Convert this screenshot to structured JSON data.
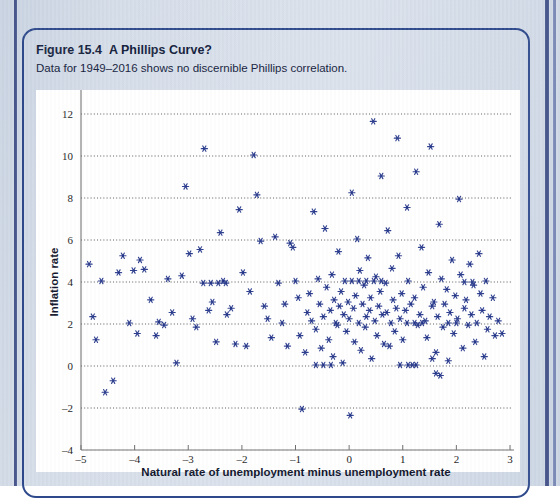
{
  "figure": {
    "number": "Figure 15.4",
    "title": "A Phillips Curve?",
    "subtitle": "Data for 1949–2016 shows no discernible Phillips correlation."
  },
  "colors": {
    "marker": "#24368a",
    "frame": "#2f4a8c",
    "page_background": "#d5dde8",
    "panel_background": "#ffffff",
    "gridline": "#3b3b3b",
    "axis": "#6f6f6f"
  },
  "chart_data": {
    "type": "scatter",
    "title": "A Phillips Curve?",
    "subtitle": "Data for 1949–2016 shows no discernible Phillips correlation.",
    "xlabel": "Natural rate of unemployment minus unemployment rate",
    "ylabel": "Inflation rate",
    "xlim": [
      -5,
      3
    ],
    "ylim": [
      -4,
      12
    ],
    "xticks": [
      -5,
      -4,
      -3,
      -2,
      -1,
      0,
      1,
      2,
      3
    ],
    "xticklabels": [
      "–5",
      "–4",
      "–3",
      "–2",
      "–1",
      "0",
      "1",
      "2",
      "3"
    ],
    "yticks": [
      -4,
      -2,
      0,
      2,
      4,
      6,
      8,
      10,
      12
    ],
    "yticklabels": [
      "–4",
      "–2",
      "0",
      "2",
      "4",
      "6",
      "8",
      "10",
      "12"
    ],
    "grid": "horizontal-dotted",
    "legend": "none",
    "marker_style": "asterisk",
    "marker_color": "#24368a",
    "n_points": 201,
    "points": [
      [
        -4.85,
        4.85
      ],
      [
        -4.78,
        2.35
      ],
      [
        -4.72,
        1.25
      ],
      [
        -4.62,
        4.05
      ],
      [
        -4.55,
        -1.25
      ],
      [
        -4.4,
        -0.7
      ],
      [
        -4.3,
        4.45
      ],
      [
        -4.22,
        5.25
      ],
      [
        -4.1,
        2.05
      ],
      [
        -4.02,
        4.55
      ],
      [
        -3.95,
        1.55
      ],
      [
        -3.9,
        5.05
      ],
      [
        -3.82,
        4.6
      ],
      [
        -3.7,
        3.15
      ],
      [
        -3.6,
        1.45
      ],
      [
        -3.55,
        2.1
      ],
      [
        -3.45,
        1.95
      ],
      [
        -3.38,
        4.15
      ],
      [
        -3.3,
        2.55
      ],
      [
        -3.22,
        0.15
      ],
      [
        -3.12,
        4.3
      ],
      [
        -3.05,
        8.55
      ],
      [
        -2.98,
        5.35
      ],
      [
        -2.92,
        2.25
      ],
      [
        -2.85,
        1.85
      ],
      [
        -2.78,
        5.55
      ],
      [
        -2.7,
        10.35
      ],
      [
        -2.62,
        2.65
      ],
      [
        -2.55,
        3.05
      ],
      [
        -2.48,
        1.15
      ],
      [
        -2.4,
        6.35
      ],
      [
        -2.35,
        4.05
      ],
      [
        -2.28,
        2.45
      ],
      [
        -2.2,
        2.75
      ],
      [
        -2.12,
        1.05
      ],
      [
        -2.05,
        7.45
      ],
      [
        -1.98,
        4.45
      ],
      [
        -1.92,
        0.95
      ],
      [
        -1.85,
        3.55
      ],
      [
        -1.78,
        10.05
      ],
      [
        -1.72,
        8.15
      ],
      [
        -1.65,
        5.95
      ],
      [
        -1.58,
        2.85
      ],
      [
        -1.52,
        2.25
      ],
      [
        -1.45,
        1.35
      ],
      [
        -1.38,
        6.15
      ],
      [
        -1.32,
        3.95
      ],
      [
        -1.25,
        2.05
      ],
      [
        -1.2,
        2.95
      ],
      [
        -1.15,
        0.95
      ],
      [
        -1.1,
        5.85
      ],
      [
        -1.05,
        5.65
      ],
      [
        -1.0,
        4.05
      ],
      [
        -0.95,
        3.25
      ],
      [
        -0.92,
        1.45
      ],
      [
        -0.88,
        -2.05
      ],
      [
        -0.82,
        0.65
      ],
      [
        -0.78,
        2.55
      ],
      [
        -0.74,
        3.45
      ],
      [
        -0.7,
        2.15
      ],
      [
        -0.66,
        7.35
      ],
      [
        -0.62,
        1.75
      ],
      [
        -0.58,
        4.15
      ],
      [
        -0.55,
        2.95
      ],
      [
        -0.52,
        0.85
      ],
      [
        -0.48,
        2.35
      ],
      [
        -0.45,
        6.55
      ],
      [
        -0.42,
        3.75
      ],
      [
        -0.38,
        1.25
      ],
      [
        -0.35,
        2.65
      ],
      [
        -0.32,
        4.35
      ],
      [
        -0.3,
        0.45
      ],
      [
        -0.28,
        3.15
      ],
      [
        -0.25,
        2.05
      ],
      [
        -0.22,
        1.95
      ],
      [
        -0.2,
        5.45
      ],
      [
        -0.18,
        2.85
      ],
      [
        -0.15,
        3.55
      ],
      [
        -0.12,
        0.15
      ],
      [
        -0.1,
        2.45
      ],
      [
        -0.08,
        4.05
      ],
      [
        -0.05,
        1.65
      ],
      [
        -0.02,
        3.05
      ],
      [
        0.0,
        2.25
      ],
      [
        0.02,
        -2.35
      ],
      [
        0.05,
        8.25
      ],
      [
        0.08,
        2.75
      ],
      [
        0.1,
        1.15
      ],
      [
        0.12,
        3.35
      ],
      [
        0.15,
        6.05
      ],
      [
        0.18,
        2.05
      ],
      [
        0.2,
        4.55
      ],
      [
        0.22,
        0.75
      ],
      [
        0.25,
        2.95
      ],
      [
        0.28,
        3.85
      ],
      [
        0.3,
        1.85
      ],
      [
        0.32,
        2.35
      ],
      [
        0.35,
        5.15
      ],
      [
        0.38,
        2.65
      ],
      [
        0.4,
        3.25
      ],
      [
        0.42,
        0.35
      ],
      [
        0.45,
        11.65
      ],
      [
        0.48,
        2.15
      ],
      [
        0.5,
        4.25
      ],
      [
        0.52,
        1.45
      ],
      [
        0.55,
        2.85
      ],
      [
        0.58,
        3.55
      ],
      [
        0.6,
        9.05
      ],
      [
        0.62,
        2.45
      ],
      [
        0.65,
        1.05
      ],
      [
        0.68,
        3.95
      ],
      [
        0.7,
        2.55
      ],
      [
        0.72,
        6.45
      ],
      [
        0.75,
        0.95
      ],
      [
        0.78,
        2.05
      ],
      [
        0.8,
        4.65
      ],
      [
        0.82,
        3.15
      ],
      [
        0.85,
        1.65
      ],
      [
        0.88,
        2.75
      ],
      [
        0.9,
        10.85
      ],
      [
        0.92,
        5.25
      ],
      [
        0.95,
        2.25
      ],
      [
        0.98,
        3.45
      ],
      [
        1.0,
        1.25
      ],
      [
        1.05,
        2.65
      ],
      [
        1.08,
        7.55
      ],
      [
        1.1,
        4.05
      ],
      [
        1.15,
        2.95
      ],
      [
        1.18,
        0.05
      ],
      [
        1.22,
        3.25
      ],
      [
        1.25,
        9.25
      ],
      [
        1.28,
        1.95
      ],
      [
        1.32,
        2.45
      ],
      [
        1.35,
        5.65
      ],
      [
        1.38,
        3.75
      ],
      [
        1.42,
        2.15
      ],
      [
        1.45,
        1.35
      ],
      [
        1.48,
        4.45
      ],
      [
        1.52,
        10.45
      ],
      [
        1.55,
        2.85
      ],
      [
        1.58,
        3.05
      ],
      [
        1.62,
        0.65
      ],
      [
        1.65,
        2.35
      ],
      [
        1.68,
        6.75
      ],
      [
        1.72,
        4.15
      ],
      [
        1.75,
        1.85
      ],
      [
        1.78,
        2.95
      ],
      [
        1.82,
        3.65
      ],
      [
        1.85,
        0.25
      ],
      [
        1.88,
        2.55
      ],
      [
        1.92,
        5.05
      ],
      [
        1.95,
        1.55
      ],
      [
        1.98,
        3.35
      ],
      [
        2.02,
        2.25
      ],
      [
        2.05,
        7.95
      ],
      [
        2.08,
        4.35
      ],
      [
        2.12,
        0.85
      ],
      [
        2.15,
        2.75
      ],
      [
        2.18,
        3.15
      ],
      [
        2.22,
        1.95
      ],
      [
        2.25,
        4.85
      ],
      [
        2.28,
        2.45
      ],
      [
        2.32,
        3.85
      ],
      [
        2.35,
        1.15
      ],
      [
        2.38,
        2.05
      ],
      [
        2.42,
        5.35
      ],
      [
        2.45,
        3.45
      ],
      [
        2.48,
        2.65
      ],
      [
        2.52,
        0.45
      ],
      [
        2.55,
        4.05
      ],
      [
        2.58,
        1.75
      ],
      [
        2.62,
        2.35
      ],
      [
        2.68,
        3.25
      ],
      [
        2.72,
        1.45
      ],
      [
        2.78,
        2.15
      ],
      [
        2.85,
        1.55
      ],
      [
        0.05,
        4.05
      ],
      [
        0.18,
        4.05
      ],
      [
        0.32,
        4.05
      ],
      [
        0.46,
        4.05
      ],
      [
        0.6,
        4.05
      ],
      [
        -2.72,
        3.95
      ],
      [
        -2.58,
        3.95
      ],
      [
        -2.44,
        3.95
      ],
      [
        -2.3,
        3.95
      ],
      [
        1.08,
        2.05
      ],
      [
        1.22,
        2.05
      ],
      [
        1.36,
        2.05
      ],
      [
        -0.62,
        0.05
      ],
      [
        -0.48,
        0.05
      ],
      [
        -0.34,
        0.05
      ],
      [
        0.95,
        0.05
      ],
      [
        1.1,
        0.05
      ],
      [
        1.25,
        0.05
      ],
      [
        1.85,
        2.05
      ],
      [
        2.0,
        2.05
      ],
      [
        2.15,
        4.0
      ],
      [
        2.3,
        4.0
      ],
      [
        1.62,
        -0.35
      ],
      [
        1.7,
        -0.45
      ],
      [
        1.55,
        0.35
      ]
    ]
  },
  "axes_geometry": {
    "plot_left_px": 81,
    "plot_right_px": 510,
    "plot_top_px": 114,
    "plot_bottom_px": 450,
    "px_per_x_unit": 51.75,
    "px_per_y_unit": 21.0
  }
}
